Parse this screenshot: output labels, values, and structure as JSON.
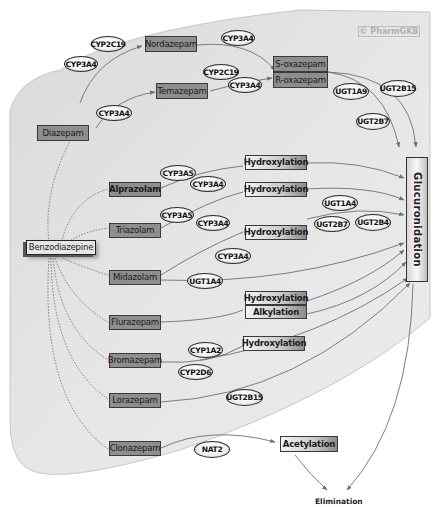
{
  "watermark": "© PharmGKB",
  "root": "Benzodiazepine",
  "sink": "Glucuronidation",
  "elimination": "Elimination",
  "drugs": {
    "diazepam": "Diazepam",
    "nordazepam": "Nordazepam",
    "temazepam": "Temazepam",
    "s_oxazepam": "S-oxazepam",
    "r_oxazepam": "R-oxazepam",
    "alprazolam": "Alprazolam",
    "triazolam": "Triazolam",
    "midazolam": "Midazolam",
    "flurazepam": "Flurazepam",
    "bromazepam": "Bromazepam",
    "lorazepam": "Lorazepam",
    "clonazepam": "Clonazepam"
  },
  "reactions": {
    "hydroxylation_alprazolam": "Hydroxylation",
    "hydroxylation_triazolam": "Hydroxylation",
    "hydroxylation_midazolam": "Hydroxylation",
    "hydroxylation_flurazepam": "Hydroxylation",
    "alkylation_flurazepam": "Alkylation",
    "hydroxylation_bromazepam": "Hydroxylation",
    "acetylation_clonazepam": "Acetylation"
  },
  "enzymes": {
    "cyp2c19_nordazepam": "CYP2C19",
    "cyp3a4_nordazepam": "CYP3A4",
    "cyp3a4_oxazepam_top": "CYP3A4",
    "cyp2c19_temazepam": "CYP2C19",
    "cyp3a4_temazepam_oxazepam": "CYP3A4",
    "cyp3a4_diazepam_temazepam": "CYP3A4",
    "ugt1a9": "UGT1A9",
    "ugt2b15_oxazepam": "UGT2B15",
    "ugt2b7_oxazepam": "UGT2B7",
    "cyp3a5_alprazolam": "CYP3A5",
    "cyp3a4_alprazolam": "CYP3A4",
    "cyp3a5_triazolam": "CYP3A5",
    "cyp3a4_triazolam": "CYP3A4",
    "ugt1a4_hydroxy": "UGT1A4",
    "ugt2b7_hydroxy": "UGT2B7",
    "ugt2b4_hydroxy": "UGT2B4",
    "cyp3a4_midazolam": "CYP3A4",
    "ugt1a4_midazolam": "UGT1A4",
    "cyp1a2_bromazepam": "CYP1A2",
    "cyp2d6_bromazepam": "CYP2D6",
    "ugt2b15_lorazepam": "UGT2B15",
    "nat2_clonazepam": "NAT2"
  },
  "colors": {
    "region_fill": "#e3e3e3",
    "drug_fill": "#8e8e8e",
    "edge": "#6f6f6f",
    "border": "#333333"
  }
}
